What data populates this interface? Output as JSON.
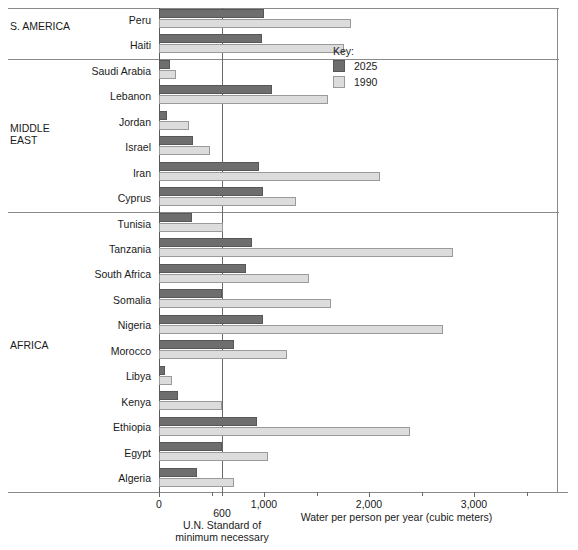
{
  "chart_data": {
    "type": "bar",
    "orientation": "horizontal",
    "title": "",
    "xlabel": "Water per person per year (cubic meters)",
    "ylabel": "",
    "xlim": [
      0,
      3800
    ],
    "grid": false,
    "legend_position": "upper-right",
    "reference_line": {
      "value": 600,
      "label_line1": "U.N. Standard of",
      "label_line2": "minimum necessary",
      "tick_label": "600"
    },
    "x_ticks": [
      0,
      1000,
      2000,
      3000
    ],
    "x_tick_labels": [
      "0",
      "1,000",
      "2,000",
      "3,000"
    ],
    "x_minor_ticks": [
      500,
      1500,
      2500,
      3500
    ],
    "series": [
      {
        "name": "2025",
        "color": "#6e6e6e",
        "values": [
          1000,
          980,
          100,
          1075,
          80,
          325,
          950,
          990,
          310,
          890,
          830,
          600,
          990,
          710,
          55,
          180,
          935,
          600,
          360
        ]
      },
      {
        "name": "1990",
        "color": "#dcdcdc",
        "values": [
          1825,
          1760,
          160,
          1610,
          290,
          490,
          2100,
          1300,
          610,
          2800,
          1430,
          1640,
          2700,
          1215,
          120,
          600,
          2390,
          1040,
          710
        ]
      }
    ],
    "categories": [
      "Peru",
      "Haiti",
      "Saudi Arabia",
      "Lebanon",
      "Jordan",
      "Israel",
      "Iran",
      "Cyprus",
      "Tunisia",
      "Tanzania",
      "South Africa",
      "Somalia",
      "Nigeria",
      "Morocco",
      "Libya",
      "Kenya",
      "Ethiopia",
      "Egypt",
      "Algeria"
    ],
    "groups": [
      {
        "label": "S.  AMERICA",
        "start": 0,
        "end": 1
      },
      {
        "label": "MIDDLE\nEAST",
        "start": 2,
        "end": 7
      },
      {
        "label": "AFRICA",
        "start": 8,
        "end": 18
      }
    ]
  },
  "legend": {
    "title": "Key:",
    "entries": [
      {
        "label": "2025",
        "color": "#6e6e6e"
      },
      {
        "label": "1990",
        "color": "#dcdcdc"
      }
    ]
  }
}
